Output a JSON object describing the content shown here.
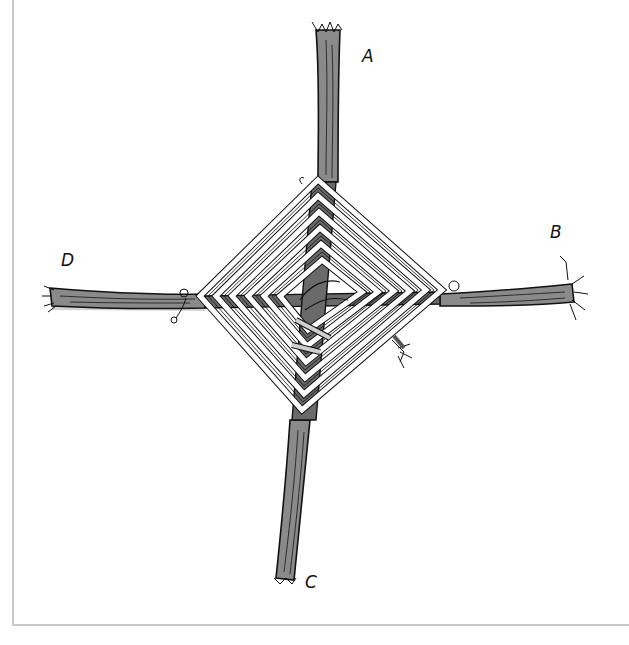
{
  "figure": {
    "colors": {
      "background": "#ffffff",
      "frame": "#c9c9c9",
      "stick_fill": "#8a8a8a",
      "stick_shadow": "#b5b5b5",
      "ink": "#111111",
      "yarn": "#ffffff"
    },
    "labels": [
      {
        "id": "A",
        "text": "A",
        "position": "top arm end",
        "x": 362,
        "y": 48
      },
      {
        "id": "B",
        "text": "B",
        "position": "right arm end",
        "x": 550,
        "y": 224
      },
      {
        "id": "C",
        "text": "C",
        "position": "bottom arm end",
        "x": 305,
        "y": 574
      },
      {
        "id": "D",
        "text": "D",
        "position": "left arm end",
        "x": 61,
        "y": 252
      }
    ]
  }
}
